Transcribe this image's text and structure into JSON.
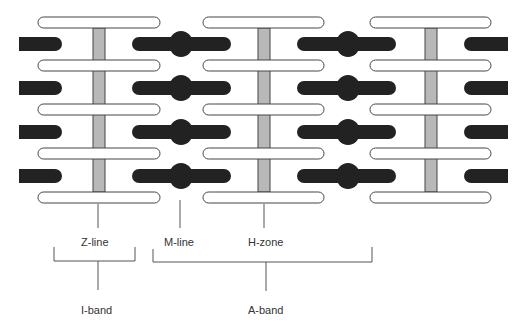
{
  "diagram": {
    "type": "sarcomere-structure",
    "colors": {
      "background": "#ffffff",
      "thin_filament_fill": "#ffffff",
      "thin_filament_stroke": "#444444",
      "thick_filament": "#222222",
      "z_line_fill": "#b8b8b8",
      "z_line_stroke": "#444444",
      "leader_line": "#555555",
      "label_text": "#333333"
    },
    "labels": {
      "z_line": "Z-line",
      "m_line": "M-line",
      "h_zone": "H-zone",
      "i_band": "I-band",
      "a_band": "A-band"
    },
    "thin_filament_rows_y": [
      17,
      60,
      104,
      148,
      192
    ],
    "thin_filament_groups": [
      {
        "x1": 38,
        "x2": 160
      },
      {
        "x1": 203,
        "x2": 324
      },
      {
        "x1": 370,
        "x2": 491
      }
    ],
    "z_lines": [
      {
        "x": 93
      },
      {
        "x": 258
      },
      {
        "x": 425
      }
    ],
    "thick_filament_rows_y": [
      44,
      88,
      132,
      176
    ],
    "thick_filaments": [
      {
        "x1": 19,
        "x2": 62,
        "bulge": false,
        "flat_left": true
      },
      {
        "x1": 132,
        "x2": 231,
        "bulge": true,
        "bulge_x": 181
      },
      {
        "x1": 297,
        "x2": 396,
        "bulge": true,
        "bulge_x": 348
      },
      {
        "x1": 464,
        "x2": 508,
        "bulge": false,
        "flat_right": true
      }
    ]
  }
}
